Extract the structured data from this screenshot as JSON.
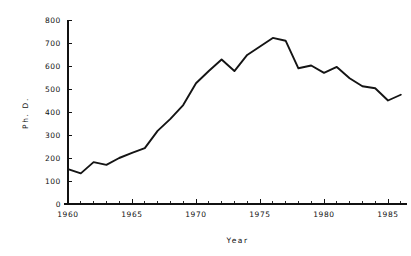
{
  "chart_data": {
    "type": "line",
    "title": "",
    "xlabel": "Year",
    "ylabel": "Ph. D.",
    "xlim": [
      1960,
      1986.5
    ],
    "ylim": [
      0,
      800
    ],
    "grid": false,
    "legend": "none",
    "x_tick_labels": [
      "1960",
      "1965",
      "1970",
      "1975",
      "1980",
      "1985"
    ],
    "x_tick_values": [
      1960,
      1965,
      1970,
      1975,
      1980,
      1985
    ],
    "x_minor_tick_values": [
      1961,
      1962,
      1963,
      1964,
      1966,
      1967,
      1968,
      1969,
      1971,
      1972,
      1973,
      1974,
      1976,
      1977,
      1978,
      1979,
      1981,
      1982,
      1983,
      1984,
      1986
    ],
    "y_tick_labels": [
      "0",
      "100",
      "200",
      "300",
      "400",
      "500",
      "600",
      "700",
      "800"
    ],
    "y_tick_values": [
      0,
      100,
      200,
      300,
      400,
      500,
      600,
      700,
      800
    ],
    "series": [
      {
        "name": "Ph.D. degrees awarded",
        "x": [
          1960,
          1961,
          1962,
          1963,
          1964,
          1965,
          1966,
          1967,
          1968,
          1969,
          1970,
          1971,
          1972,
          1973,
          1974,
          1975,
          1976,
          1977,
          1978,
          1979,
          1980,
          1981,
          1982,
          1983,
          1984,
          1985,
          1986
        ],
        "values": [
          152,
          133,
          182,
          170,
          200,
          222,
          243,
          318,
          370,
          430,
          525,
          578,
          628,
          578,
          648,
          685,
          722,
          710,
          590,
          602,
          570,
          596,
          547,
          512,
          503,
          450,
          475
        ]
      }
    ],
    "line_color": "#141414"
  },
  "axes": {
    "x_axis_name": "year-axis",
    "y_axis_name": "phd-axis"
  }
}
